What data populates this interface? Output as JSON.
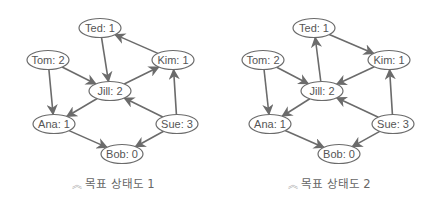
{
  "colors": {
    "edge": "#6b6b6b",
    "node_stroke": "#6b6b6b",
    "node_fill": "#ffffff",
    "text": "#555555",
    "caption_icon": "#aaaaaa"
  },
  "diagrams": [
    {
      "caption": "목표 상태도 1",
      "caption_icon": "double-chevron-up-icon",
      "nodes": [
        {
          "id": "Ted",
          "label": "Ted: 1",
          "x": 100,
          "y": 28
        },
        {
          "id": "Tom",
          "label": "Tom: 2",
          "x": 48,
          "y": 60
        },
        {
          "id": "Kim",
          "label": "Kim: 1",
          "x": 173,
          "y": 60
        },
        {
          "id": "Jill",
          "label": "Jill: 2",
          "x": 110,
          "y": 91
        },
        {
          "id": "Ana",
          "label": "Ana: 1",
          "x": 54,
          "y": 124
        },
        {
          "id": "Sue",
          "label": "Sue: 3",
          "x": 177,
          "y": 124
        },
        {
          "id": "Bob",
          "label": "Bob: 0",
          "x": 122,
          "y": 154
        }
      ],
      "edges": [
        [
          "Ted",
          "Jill"
        ],
        [
          "Kim",
          "Ted"
        ],
        [
          "Tom",
          "Jill"
        ],
        [
          "Tom",
          "Ana"
        ],
        [
          "Jill",
          "Kim"
        ],
        [
          "Jill",
          "Ana"
        ],
        [
          "Sue",
          "Jill"
        ],
        [
          "Sue",
          "Kim"
        ],
        [
          "Ana",
          "Bob"
        ],
        [
          "Sue",
          "Bob"
        ]
      ]
    },
    {
      "caption": "목표 상태도 2",
      "caption_icon": "double-chevron-up-icon",
      "nodes": [
        {
          "id": "Ted",
          "label": "Ted: 1",
          "x": 96,
          "y": 28
        },
        {
          "id": "Tom",
          "label": "Tom: 2",
          "x": 45,
          "y": 60
        },
        {
          "id": "Kim",
          "label": "Kim: 1",
          "x": 171,
          "y": 60
        },
        {
          "id": "Jill",
          "label": "Jill: 2",
          "x": 104,
          "y": 91
        },
        {
          "id": "Ana",
          "label": "Ana: 1",
          "x": 52,
          "y": 124
        },
        {
          "id": "Sue",
          "label": "Sue: 3",
          "x": 175,
          "y": 124
        },
        {
          "id": "Bob",
          "label": "Bob: 0",
          "x": 121,
          "y": 154
        }
      ],
      "edges": [
        [
          "Jill",
          "Ted"
        ],
        [
          "Ted",
          "Kim"
        ],
        [
          "Kim",
          "Jill"
        ],
        [
          "Tom",
          "Jill"
        ],
        [
          "Tom",
          "Ana"
        ],
        [
          "Jill",
          "Ana"
        ],
        [
          "Sue",
          "Jill"
        ],
        [
          "Sue",
          "Kim"
        ],
        [
          "Ana",
          "Bob"
        ],
        [
          "Sue",
          "Bob"
        ]
      ]
    }
  ]
}
